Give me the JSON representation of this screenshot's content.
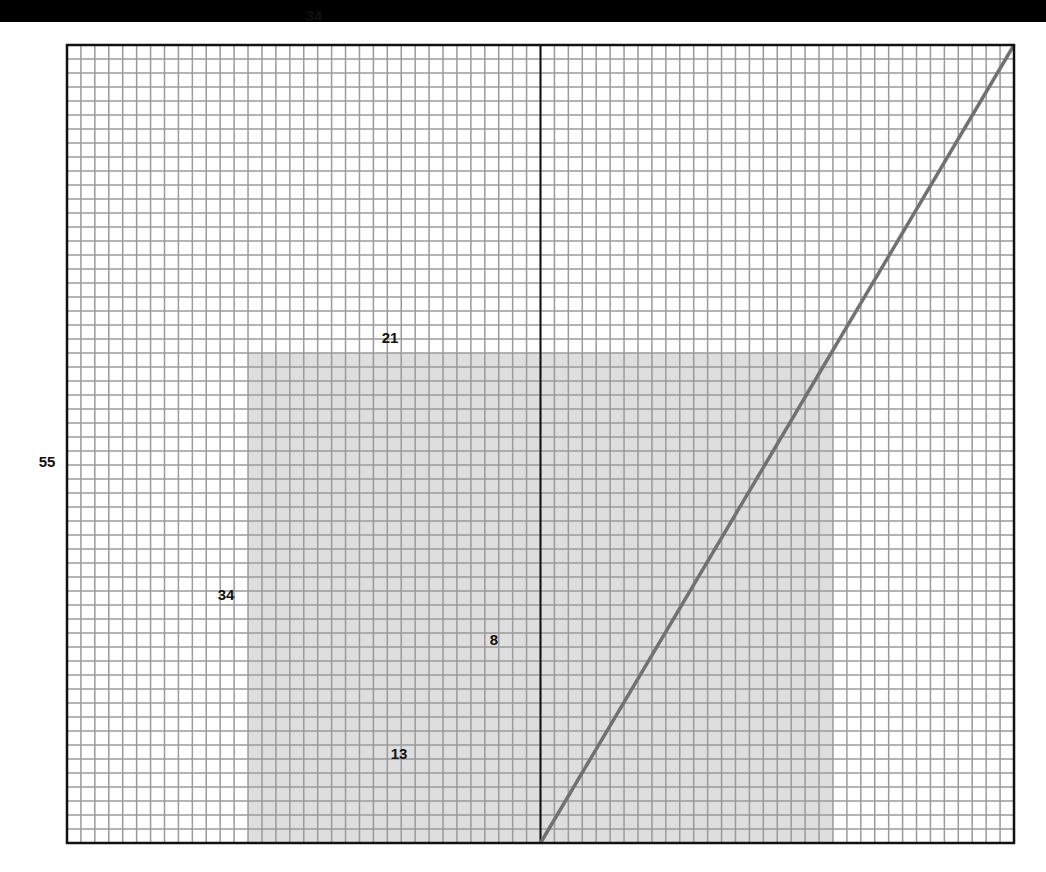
{
  "diagram": {
    "grid": {
      "columns": 68,
      "rows": 57,
      "left": 67,
      "top": 45,
      "right": 1014,
      "bottom": 843,
      "line_color": "#9a9a9a",
      "border_color": "#111111"
    },
    "shaded_region": {
      "col_start": 13,
      "col_end": 55,
      "row_start": 22,
      "row_end": 57,
      "color": "#dedede"
    },
    "vertical_divider": {
      "col": 34,
      "color": "#111111"
    },
    "diagonal_line": {
      "from_col": 34,
      "from_row": 57,
      "to_col": 68,
      "to_row": 0,
      "color": "#717171"
    },
    "labels": [
      {
        "id": "top-34",
        "text": "34",
        "x": 314,
        "y": 15
      },
      {
        "id": "left-55",
        "text": "55",
        "x": 47,
        "y": 461
      },
      {
        "id": "shaded-top-21",
        "text": "21",
        "x": 390,
        "y": 337
      },
      {
        "id": "shaded-left-34",
        "text": "34",
        "x": 226,
        "y": 594
      },
      {
        "id": "inner-8",
        "text": "8",
        "x": 494,
        "y": 639
      },
      {
        "id": "inner-13",
        "text": "13",
        "x": 399,
        "y": 753
      }
    ]
  }
}
